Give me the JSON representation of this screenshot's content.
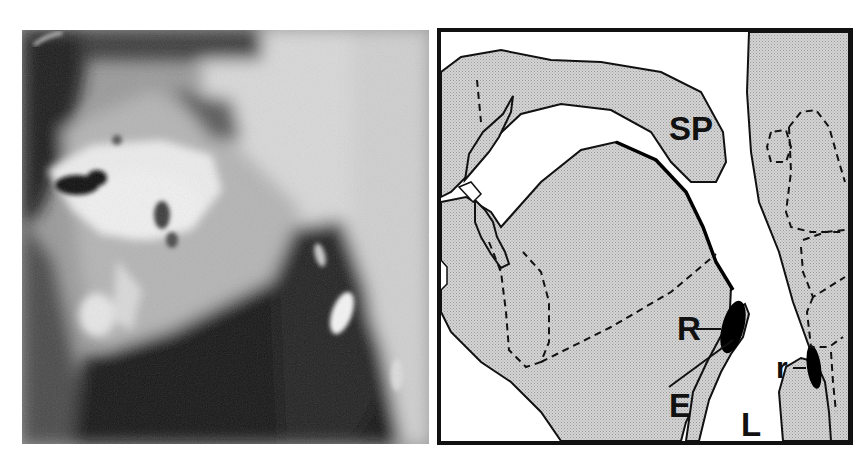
{
  "figure": {
    "left_panel": {
      "kind": "radiograph",
      "description": "Lateral videofluoroscopic X-ray of the oral cavity and pharynx with radiopaque contrast"
    },
    "right_panel": {
      "kind": "anatomical-line-drawing",
      "labels": {
        "soft_palate": "SP",
        "residue_valleculae": "R",
        "epiglottis": "E",
        "residue_pyriform": "r",
        "larynx": "L"
      }
    },
    "colors": {
      "tissue_fill": "#c8c8c8",
      "outline": "#111111",
      "air_space": "#ffffff",
      "bolus": "#000000"
    }
  }
}
